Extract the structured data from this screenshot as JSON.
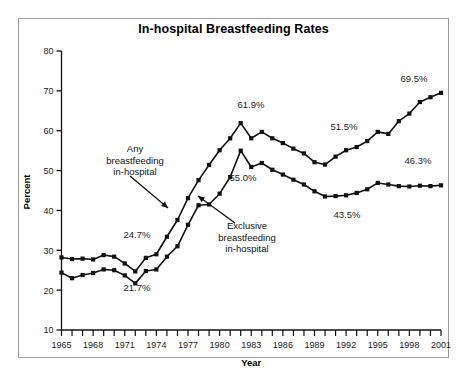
{
  "chart_data": {
    "type": "line",
    "title": "In-hospital Breastfeeding Rates",
    "xlabel": "Year",
    "ylabel": "Percent",
    "xlim": [
      1965,
      2001
    ],
    "ylim": [
      10,
      80
    ],
    "ytick_labels": [
      "10",
      "20",
      "30",
      "40",
      "50",
      "60",
      "70",
      "80"
    ],
    "ytick_values": [
      10,
      20,
      30,
      40,
      50,
      60,
      70,
      80
    ],
    "xtick_labels": [
      "1965",
      "1968",
      "1971",
      "1974",
      "1977",
      "1980",
      "1983",
      "1986",
      "1989",
      "1992",
      "1995",
      "1998",
      "2001"
    ],
    "xtick_values": [
      1965,
      1968,
      1971,
      1974,
      1977,
      1980,
      1983,
      1986,
      1989,
      1992,
      1995,
      1998,
      2001
    ],
    "grid": false,
    "legend": "annotations",
    "x": [
      1965,
      1966,
      1967,
      1968,
      1969,
      1970,
      1971,
      1972,
      1973,
      1974,
      1975,
      1976,
      1977,
      1978,
      1979,
      1980,
      1981,
      1982,
      1983,
      1984,
      1985,
      1986,
      1987,
      1988,
      1989,
      1990,
      1991,
      1992,
      1993,
      1994,
      1995,
      1996,
      1997,
      1998,
      1999,
      2000,
      2001
    ],
    "series": [
      {
        "name": "Any breastfeeding in-hospital",
        "marker": "square",
        "values": [
          28.2,
          27.8,
          27.9,
          27.7,
          28.8,
          28.4,
          26.7,
          24.7,
          28.1,
          29.0,
          33.4,
          37.6,
          43.1,
          47.6,
          51.4,
          55.1,
          58.1,
          61.9,
          58.1,
          59.7,
          58.1,
          56.9,
          55.5,
          54.3,
          52.1,
          51.5,
          53.5,
          55.1,
          55.9,
          57.4,
          59.7,
          59.2,
          62.4,
          64.3,
          67.2,
          68.4,
          69.5
        ],
        "labels": [
          {
            "x": 1973,
            "y": 24.7,
            "text": "24.7%"
          },
          {
            "x": 1982,
            "y": 61.9,
            "text": "61.9%"
          },
          {
            "x": 1990,
            "y": 51.5,
            "text": "51.5%"
          },
          {
            "x": 2001,
            "y": 69.5,
            "text": "69.5%"
          }
        ]
      },
      {
        "name": "Exclusive breastfeeding in-hospital",
        "marker": "square",
        "values": [
          24.4,
          23.0,
          23.8,
          24.3,
          25.2,
          25.0,
          23.7,
          21.7,
          24.8,
          25.2,
          28.4,
          31.0,
          36.4,
          41.3,
          41.5,
          44.2,
          48.4,
          55.0,
          50.9,
          51.9,
          50.2,
          49.0,
          47.7,
          46.5,
          44.8,
          43.5,
          43.6,
          43.8,
          44.4,
          45.3,
          46.9,
          46.5,
          46.1,
          46.0,
          46.2,
          46.1,
          46.3
        ],
        "labels": [
          {
            "x": 1972,
            "y": 21.7,
            "text": "21.7%"
          },
          {
            "x": 1982,
            "y": 55.0,
            "text": "55.0%"
          },
          {
            "x": 1990,
            "y": 43.5,
            "text": "43.5%"
          },
          {
            "x": 2001,
            "y": 46.3,
            "text": "46.3%"
          }
        ]
      }
    ],
    "annotations": [
      {
        "name": "any-breastfeeding-annotation",
        "lines": [
          "Any",
          "breastfeeding",
          "in-hospital"
        ],
        "text_x": 135,
        "text_y": 152,
        "arrow": {
          "x1": 130,
          "y1": 176,
          "x2": 168,
          "y2": 208
        }
      },
      {
        "name": "exclusive-breastfeeding-annotation",
        "lines": [
          "Exclusive",
          "breastfeeding",
          "in-hospital"
        ],
        "text_x": 247,
        "text_y": 229,
        "arrow": {
          "x1": 235,
          "y1": 223,
          "x2": 198,
          "y2": 196
        }
      }
    ],
    "value_label_positions": [
      {
        "name": "label-24-7",
        "text": "24.7%",
        "x": 137,
        "y": 238
      },
      {
        "name": "label-21-7",
        "text": "21.7%",
        "x": 137,
        "y": 291
      },
      {
        "name": "label-61-9",
        "text": "61.9%",
        "x": 251,
        "y": 108
      },
      {
        "name": "label-55-0",
        "text": "55.0%",
        "x": 243,
        "y": 181
      },
      {
        "name": "label-51-5",
        "text": "51.5%",
        "x": 344,
        "y": 130
      },
      {
        "name": "label-43-5",
        "text": "43.5%",
        "x": 347,
        "y": 218
      },
      {
        "name": "label-69-5",
        "text": "69.5%",
        "x": 414,
        "y": 82
      },
      {
        "name": "label-46-3",
        "text": "46.3%",
        "x": 418,
        "y": 164
      }
    ],
    "colors": {
      "line": "#111111",
      "marker": "#111111",
      "text": "#1a1a1a",
      "frame": "#9a9a9a",
      "background": "#ffffff"
    }
  }
}
